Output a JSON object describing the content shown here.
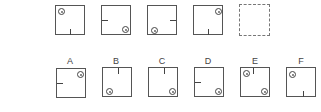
{
  "puzzle": {
    "sequence": [
      {
        "id": "q1",
        "circles": [
          "top-left"
        ],
        "ticks": [
          "bottom-center-up"
        ]
      },
      {
        "id": "q2",
        "circles": [
          "bottom-right"
        ],
        "ticks": [
          "left-middle-in"
        ]
      },
      {
        "id": "q3",
        "circles": [
          "bottom-left"
        ],
        "ticks": [
          "right-middle-in"
        ]
      },
      {
        "id": "q4",
        "circles": [
          "top-right"
        ],
        "ticks": [
          "bottom-center-up"
        ]
      },
      {
        "id": "q5",
        "placeholder": true
      }
    ],
    "options": [
      {
        "label": "A",
        "circles": [
          "top-right"
        ],
        "ticks": [
          "left-middle-in"
        ]
      },
      {
        "label": "B",
        "circles": [
          "bottom-left"
        ],
        "ticks": [
          "top-center-down"
        ]
      },
      {
        "label": "C",
        "circles": [
          "bottom-right"
        ],
        "ticks": [
          "top-center-down"
        ]
      },
      {
        "label": "D",
        "circles": [
          "bottom-right"
        ],
        "ticks": [
          "left-middle-in"
        ]
      },
      {
        "label": "E",
        "circles": [
          "top-left",
          "bottom-right"
        ],
        "ticks": [
          "top-center-down"
        ]
      },
      {
        "label": "F",
        "circles": [
          "top-left"
        ],
        "ticks": [
          "bottom-center-up"
        ]
      }
    ]
  },
  "labels": {
    "a": "A",
    "b": "B",
    "c": "C",
    "d": "D",
    "e": "E",
    "f": "F"
  },
  "colors": {
    "stroke": "#555555",
    "background": "#ffffff"
  }
}
